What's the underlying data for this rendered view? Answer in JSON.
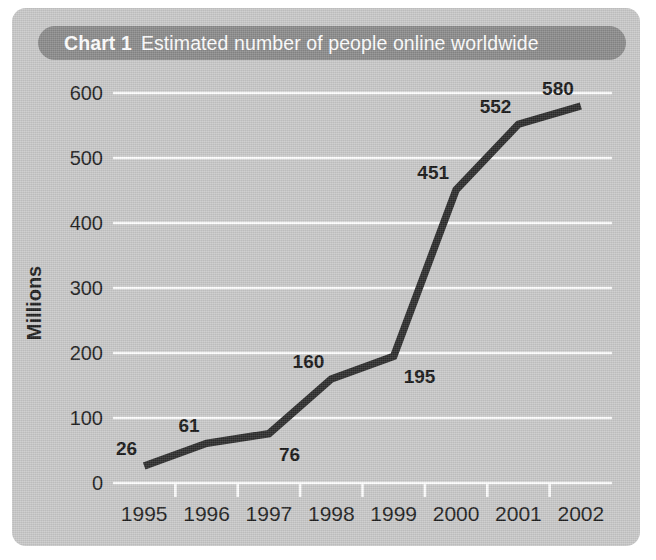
{
  "card": {
    "background_color": "#c9c9c9",
    "banner_color": "#8a8a8a",
    "line_color": "#2b2b2b",
    "gridline_color": "#ffffff",
    "text_color": "#1d1d1d"
  },
  "title": {
    "chart_number": "Chart 1",
    "caption": "Estimated number of people online worldwide"
  },
  "chart_data": {
    "type": "line",
    "xlabel": "",
    "ylabel": "Millions",
    "categories": [
      "1995",
      "1996",
      "1997",
      "1998",
      "1999",
      "2000",
      "2001",
      "2002"
    ],
    "values": [
      26,
      61,
      76,
      160,
      195,
      451,
      552,
      580
    ],
    "point_labels": [
      "26",
      "61",
      "76",
      "160",
      "195",
      "451",
      "552",
      "580"
    ],
    "label_placement": [
      "above-left",
      "above-left",
      "below-right",
      "above-left",
      "below-right",
      "above-left",
      "above-left",
      "above-left"
    ],
    "ylim": [
      0,
      600
    ],
    "yticks": [
      0,
      100,
      200,
      300,
      400,
      500,
      600
    ],
    "ytick_labels": [
      "0",
      "100",
      "200",
      "300",
      "400",
      "500",
      "600"
    ],
    "grid": true,
    "grid_axis": "y",
    "legend": false,
    "legend_position": "none",
    "series": [
      {
        "name": "People online worldwide (millions)",
        "values": [
          26,
          61,
          76,
          160,
          195,
          451,
          552,
          580
        ]
      }
    ]
  }
}
